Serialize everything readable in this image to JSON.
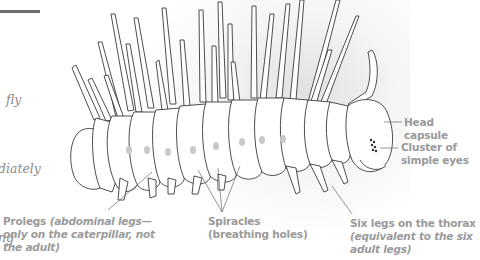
{
  "intro": {
    "lines": [
      "fly",
      "diately",
      "ing"
    ]
  },
  "labels": {
    "head_capsule": "Head capsule",
    "eyes_line1": "Cluster of",
    "eyes_line2": "simple eyes",
    "prolegs_bold": "Prolegs ",
    "prolegs_italic_1": "(abdominal legs—",
    "prolegs_italic_2": "only on the caterpillar, not",
    "prolegs_italic_3": "the adult)",
    "spiracles_line1": "Spiracles",
    "spiracles_line2": "(breathing holes)",
    "thorax_line1": "Six legs on the thorax",
    "thorax_italic_1": "(equivalent to the six",
    "thorax_italic_2": "adult legs)"
  },
  "colors": {
    "label_gray": "#9a9a9a",
    "outline": "#3a3a3a",
    "rule": "#6b6b6b"
  }
}
